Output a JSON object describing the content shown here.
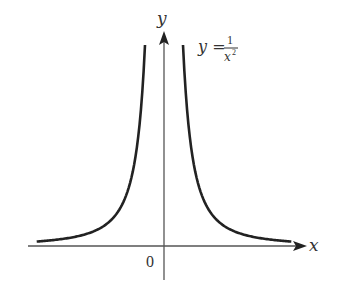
{
  "chart_data": {
    "type": "line",
    "title": "",
    "function": "y = 1/x^2",
    "annotation": {
      "lhs": "y =",
      "numerator": "1",
      "denominator": "x",
      "exponent": "2"
    },
    "xlabel": "x",
    "ylabel": "y",
    "origin_label": "0",
    "series": [
      {
        "name": "y = 1/x^2 (x<0)",
        "x": [
          -6.7,
          -4,
          -3,
          -2,
          -1.5,
          -1.2,
          -1
        ],
        "y": [
          0.022,
          0.0625,
          0.111,
          0.25,
          0.444,
          0.694,
          1
        ]
      },
      {
        "name": "y = 1/x^2 (x>0)",
        "x": [
          1,
          1.2,
          1.5,
          2,
          3,
          4,
          6.7
        ],
        "y": [
          1,
          0.694,
          0.444,
          0.25,
          0.111,
          0.0625,
          0.022
        ]
      }
    ],
    "grid": false,
    "legend": "none",
    "colors": {
      "curve": "#222222",
      "axis": "#444444"
    }
  }
}
